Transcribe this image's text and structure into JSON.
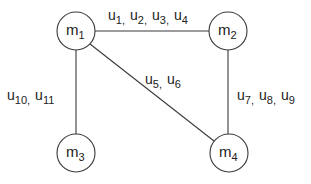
{
  "diagram": {
    "type": "graph",
    "nodes": [
      {
        "id": "m1",
        "base": "m",
        "sub": "1",
        "cx": 76,
        "cy": 31,
        "r": 19
      },
      {
        "id": "m2",
        "base": "m",
        "sub": "2",
        "cx": 228,
        "cy": 31,
        "r": 19
      },
      {
        "id": "m3",
        "base": "m",
        "sub": "3",
        "cx": 76,
        "cy": 153,
        "r": 19
      },
      {
        "id": "m4",
        "base": "m",
        "sub": "4",
        "cx": 229,
        "cy": 153,
        "r": 19
      }
    ],
    "edges": [
      {
        "from": "m1",
        "to": "m2",
        "labels": [
          "1",
          "2",
          "3",
          "4"
        ],
        "label_text": "u1, u2, u3, u4"
      },
      {
        "from": "m1",
        "to": "m4",
        "labels": [
          "5",
          "6"
        ],
        "label_text": "u5, u6"
      },
      {
        "from": "m2",
        "to": "m4",
        "labels": [
          "7",
          "8",
          "9"
        ],
        "label_text": "u7, u8, u9"
      },
      {
        "from": "m1",
        "to": "m3",
        "labels": [
          "10",
          "11"
        ],
        "label_text": "u10, u11"
      }
    ],
    "colors": {
      "stroke": "#3a3a3a",
      "text": "#222222",
      "background": "#ffffff"
    }
  },
  "labels": {
    "m1": {
      "base": "m",
      "sub": "1"
    },
    "m2": {
      "base": "m",
      "sub": "2"
    },
    "m3": {
      "base": "m",
      "sub": "3"
    },
    "m4": {
      "base": "m",
      "sub": "4"
    },
    "e12": [
      {
        "b": "u",
        "s": "1",
        "sep": ","
      },
      {
        "b": "u",
        "s": "2",
        "sep": ","
      },
      {
        "b": "u",
        "s": "3",
        "sep": ","
      },
      {
        "b": "u",
        "s": "4",
        "sep": ""
      }
    ],
    "e14": [
      {
        "b": "u",
        "s": "5",
        "sep": ","
      },
      {
        "b": "u",
        "s": "6",
        "sep": ""
      }
    ],
    "e24": [
      {
        "b": "u",
        "s": "7",
        "sep": ","
      },
      {
        "b": "u",
        "s": "8",
        "sep": ","
      },
      {
        "b": "u",
        "s": "9",
        "sep": ""
      }
    ],
    "e13": [
      {
        "b": "u",
        "s": "10",
        "sep": ","
      },
      {
        "b": "u",
        "s": "11",
        "sep": ""
      }
    ]
  }
}
